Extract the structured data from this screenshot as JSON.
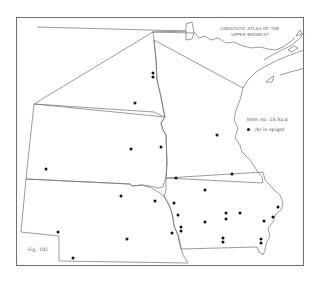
{
  "map": {
    "title_line1": "LINGUISTIC ATLAS OF THE",
    "title_line2": "UPPER MIDWEST",
    "figure_label": "Fig. 101",
    "legend": {
      "item_number": "Item no. 15.5a,b",
      "symbol": "dot",
      "symbol_label": "/k/ in spigot"
    },
    "region_states": [
      "North Dakota",
      "South Dakota",
      "Nebraska",
      "Minnesota",
      "Iowa"
    ],
    "colors": {
      "line": "#707070",
      "dot": "#111111",
      "background": "#ffffff"
    },
    "points": [
      {
        "state": "North Dakota",
        "x": 153,
        "y": 73
      },
      {
        "state": "North Dakota",
        "x": 153,
        "y": 77
      },
      {
        "state": "North Dakota",
        "x": 135,
        "y": 103
      },
      {
        "state": "South Dakota",
        "x": 131,
        "y": 149
      },
      {
        "state": "South Dakota",
        "x": 161,
        "y": 147
      },
      {
        "state": "South Dakota",
        "x": 46,
        "y": 169
      },
      {
        "state": "Minnesota",
        "x": 217,
        "y": 135
      },
      {
        "state": "Iowa",
        "x": 176,
        "y": 178
      },
      {
        "state": "Iowa",
        "x": 232,
        "y": 174
      },
      {
        "state": "Iowa",
        "x": 205,
        "y": 190
      },
      {
        "state": "Iowa",
        "x": 174,
        "y": 203
      },
      {
        "state": "Iowa",
        "x": 178,
        "y": 215
      },
      {
        "state": "Iowa",
        "x": 181,
        "y": 227
      },
      {
        "state": "Iowa",
        "x": 181,
        "y": 231
      },
      {
        "state": "Iowa",
        "x": 205,
        "y": 222
      },
      {
        "state": "Iowa",
        "x": 226,
        "y": 213
      },
      {
        "state": "Iowa",
        "x": 226,
        "y": 219
      },
      {
        "state": "Iowa",
        "x": 240,
        "y": 213
      },
      {
        "state": "Iowa",
        "x": 223,
        "y": 238
      },
      {
        "state": "Iowa",
        "x": 223,
        "y": 242
      },
      {
        "state": "Iowa",
        "x": 264,
        "y": 221
      },
      {
        "state": "Iowa",
        "x": 273,
        "y": 217
      },
      {
        "state": "Iowa",
        "x": 278,
        "y": 207
      },
      {
        "state": "Iowa",
        "x": 261,
        "y": 239
      },
      {
        "state": "Iowa",
        "x": 261,
        "y": 243
      },
      {
        "state": "Nebraska",
        "x": 121,
        "y": 196
      },
      {
        "state": "Nebraska",
        "x": 155,
        "y": 201
      },
      {
        "state": "Nebraska",
        "x": 172,
        "y": 233
      },
      {
        "state": "Nebraska",
        "x": 58,
        "y": 232
      },
      {
        "state": "Nebraska",
        "x": 127,
        "y": 239
      },
      {
        "state": "Nebraska",
        "x": 73,
        "y": 258
      }
    ]
  }
}
